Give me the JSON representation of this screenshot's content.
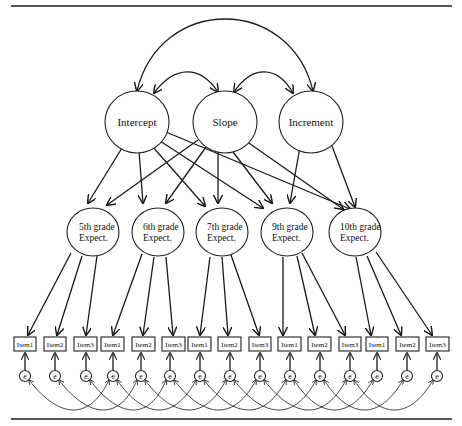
{
  "diagram": {
    "type": "latent growth curve / structural equation model",
    "growth_factors": [
      {
        "id": "intercept",
        "label": "Intercept"
      },
      {
        "id": "slope",
        "label": "Slope"
      },
      {
        "id": "increment",
        "label": "Increment"
      }
    ],
    "factor_covariances": [
      [
        "intercept",
        "slope"
      ],
      [
        "slope",
        "increment"
      ],
      [
        "intercept",
        "increment"
      ]
    ],
    "grade_factors": [
      {
        "id": "g5",
        "line1": "5th grade",
        "line2": "Expect."
      },
      {
        "id": "g6",
        "line1": "6th grade",
        "line2": "Expect."
      },
      {
        "id": "g7",
        "line1": "7th grade",
        "line2": "Expect."
      },
      {
        "id": "g9",
        "line1": "9th grade",
        "line2": "Expect."
      },
      {
        "id": "g10",
        "line1": "10th grade",
        "line2": "Expect."
      }
    ],
    "loadings": {
      "intercept": [
        "g5",
        "g6",
        "g7",
        "g9",
        "g10"
      ],
      "slope": [
        "g5",
        "g6",
        "g7",
        "g9",
        "g10"
      ],
      "increment": [
        "g9",
        "g10"
      ]
    },
    "items": [
      {
        "grade": "g5",
        "label": "Item1"
      },
      {
        "grade": "g5",
        "label": "Item2"
      },
      {
        "grade": "g5",
        "label": "Item3"
      },
      {
        "grade": "g6",
        "label": "Item1"
      },
      {
        "grade": "g6",
        "label": "Item2"
      },
      {
        "grade": "g6",
        "label": "Item3"
      },
      {
        "grade": "g7",
        "label": "Item1"
      },
      {
        "grade": "g7",
        "label": "Item2"
      },
      {
        "grade": "g7",
        "label": "Item3"
      },
      {
        "grade": "g9",
        "label": "Item1"
      },
      {
        "grade": "g9",
        "label": "Item2"
      },
      {
        "grade": "g9",
        "label": "Item3"
      },
      {
        "grade": "g10",
        "label": "Item1"
      },
      {
        "grade": "g10",
        "label": "Item2"
      },
      {
        "grade": "g10",
        "label": "Item3"
      }
    ],
    "error_label": "e",
    "error_covariances": "same item correlated across adjacent grades"
  }
}
